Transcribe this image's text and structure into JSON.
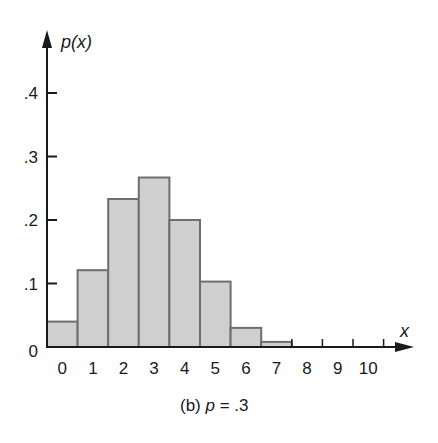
{
  "chart_data": {
    "type": "bar",
    "title": "",
    "caption": "(b) p = .3",
    "caption_parts": {
      "prefix": "(b) ",
      "var": "p",
      "rest": " = .3"
    },
    "xlabel": "x",
    "ylabel": "p(x)",
    "categories": [
      "0",
      "1",
      "2",
      "3",
      "4",
      "5",
      "6",
      "7",
      "8",
      "9",
      "10"
    ],
    "values": [
      0.04,
      0.121,
      0.233,
      0.267,
      0.2,
      0.103,
      0.03,
      0.008,
      0.001,
      0.0,
      0.0
    ],
    "ylim": [
      0,
      0.45
    ],
    "yticks": [
      0,
      0.1,
      0.2,
      0.3,
      0.4
    ],
    "ytick_labels": [
      "0",
      ".1",
      ".2",
      ".3",
      ".4"
    ],
    "xtick_labels": [
      "0",
      "1",
      "2",
      "3",
      "4",
      "5",
      "6",
      "7",
      "8",
      "9",
      "10"
    ],
    "grid": false,
    "legend": null,
    "bar_fill": "#cfcfcf",
    "bar_edge": "#6e6e6e",
    "axis_color": "#1a1a1a"
  }
}
